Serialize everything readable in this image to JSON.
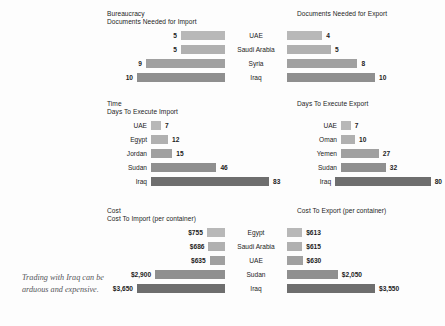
{
  "caption": "Trading with Iraq can be arduous and expensive.",
  "palette": {
    "bar_1": "#b8b8b8",
    "bar_2": "#b0b0b0",
    "bar_3": "#a0a0a0",
    "bar_4": "#8f8f8f",
    "bar_5": "#6e6e6e",
    "background": "#fdfdfd",
    "text": "#1c1c1c",
    "caption_text": "#55555a"
  },
  "sections": [
    {
      "category": "Bureaucracy",
      "left_title": "Documents Needed for Import",
      "right_title": "Documents Needed for Export",
      "countries": [
        "UAE",
        "Saudi Arabia",
        "Syria",
        "Iraq"
      ],
      "left_values": [
        "5",
        "5",
        "9",
        "10"
      ],
      "right_values": [
        "4",
        "5",
        "8",
        "10"
      ]
    },
    {
      "category": "Time",
      "left_title": "Days To Execute Import",
      "right_title": "Days To Execute Export",
      "left_countries": [
        "UAE",
        "Egypt",
        "Jordan",
        "Sudan",
        "Iraq"
      ],
      "left_values": [
        "7",
        "12",
        "15",
        "46",
        "83"
      ],
      "right_countries": [
        "UAE",
        "Oman",
        "Yemen",
        "Sudan",
        "Iraq"
      ],
      "right_values": [
        "7",
        "10",
        "27",
        "32",
        "80"
      ]
    },
    {
      "category": "Cost",
      "left_title": "Cost To Import (per container)",
      "right_title": "Cost To Export (per container)",
      "countries": [
        "Egypt",
        "Saudi Arabia",
        "UAE",
        "Sudan",
        "Iraq"
      ],
      "left_values": [
        "$755",
        "$686",
        "$635",
        "$2,900",
        "$3,650"
      ],
      "right_values": [
        "$613",
        "$615",
        "$630",
        "$2,050",
        "$3,550"
      ]
    }
  ],
  "chart_data": [
    {
      "type": "bar",
      "title": "Documents Needed for Import",
      "group": "Bureaucracy",
      "orientation": "horizontal-right-to-left",
      "categories": [
        "UAE",
        "Saudi Arabia",
        "Syria",
        "Iraq"
      ],
      "values": [
        5,
        5,
        9,
        10
      ],
      "xlabel": "Number of documents",
      "ylabel": "",
      "xlim": [
        0,
        10
      ],
      "grid": false,
      "legend": "none"
    },
    {
      "type": "bar",
      "title": "Documents Needed for Export",
      "group": "Bureaucracy",
      "orientation": "horizontal",
      "categories": [
        "UAE",
        "Saudi Arabia",
        "Syria",
        "Iraq"
      ],
      "values": [
        4,
        5,
        8,
        10
      ],
      "xlabel": "Number of documents",
      "ylabel": "",
      "xlim": [
        0,
        10
      ],
      "grid": false,
      "legend": "none"
    },
    {
      "type": "bar",
      "title": "Days To Execute Import",
      "group": "Time",
      "orientation": "horizontal",
      "categories": [
        "UAE",
        "Egypt",
        "Jordan",
        "Sudan",
        "Iraq"
      ],
      "values": [
        7,
        12,
        15,
        46,
        83
      ],
      "xlabel": "Days",
      "ylabel": "",
      "xlim": [
        0,
        83
      ],
      "grid": false,
      "legend": "none"
    },
    {
      "type": "bar",
      "title": "Days To Execute Export",
      "group": "Time",
      "orientation": "horizontal",
      "categories": [
        "UAE",
        "Oman",
        "Yemen",
        "Sudan",
        "Iraq"
      ],
      "values": [
        7,
        10,
        27,
        32,
        80
      ],
      "xlabel": "Days",
      "ylabel": "",
      "xlim": [
        0,
        80
      ],
      "grid": false,
      "legend": "none"
    },
    {
      "type": "bar",
      "title": "Cost To Import (per container)",
      "group": "Cost",
      "orientation": "horizontal-right-to-left",
      "categories": [
        "Egypt",
        "Saudi Arabia",
        "UAE",
        "Sudan",
        "Iraq"
      ],
      "values": [
        755,
        686,
        635,
        2900,
        3650
      ],
      "xlabel": "US dollars per container",
      "ylabel": "",
      "xlim": [
        0,
        3650
      ],
      "grid": false,
      "legend": "none"
    },
    {
      "type": "bar",
      "title": "Cost To Export (per container)",
      "group": "Cost",
      "orientation": "horizontal",
      "categories": [
        "Egypt",
        "Saudi Arabia",
        "UAE",
        "Sudan",
        "Iraq"
      ],
      "values": [
        613,
        615,
        630,
        2050,
        3550
      ],
      "xlabel": "US dollars per container",
      "ylabel": "",
      "xlim": [
        0,
        3550
      ],
      "grid": false,
      "legend": "none"
    }
  ]
}
